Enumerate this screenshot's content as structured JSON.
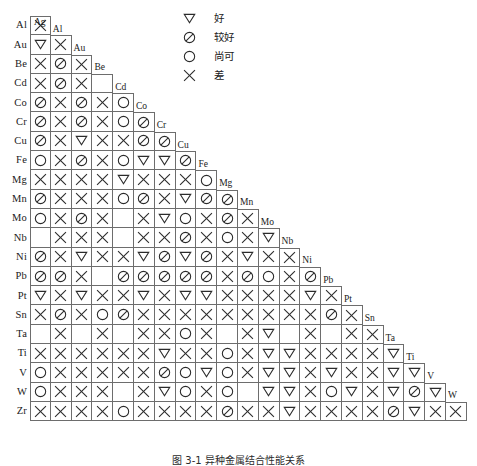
{
  "figure": {
    "caption": "图 3-1  异种金属结合性能关系"
  },
  "legend": {
    "items": [
      {
        "symbol": "triangle-down",
        "label": "好"
      },
      {
        "symbol": "circle-slash",
        "label": "较好"
      },
      {
        "symbol": "circle",
        "label": "尚可"
      },
      {
        "symbol": "cross",
        "label": "差"
      }
    ]
  },
  "matrix": {
    "row_labels": [
      "Al",
      "Au",
      "Be",
      "Cd",
      "Co",
      "Cr",
      "Cu",
      "Fe",
      "Mg",
      "Mn",
      "Mo",
      "Nb",
      "Ni",
      "Pb",
      "Pt",
      "Sn",
      "Ta",
      "Ti",
      "V",
      "W",
      "Zr"
    ],
    "column_labels": [
      "Ag",
      "Al",
      "Au",
      "Be",
      "Cd",
      "Co",
      "Cr",
      "Cu",
      "Fe",
      "Mg",
      "Mn",
      "Mo",
      "Nb",
      "Ni",
      "Pb",
      "Pt",
      "Sn",
      "Ta",
      "Ti",
      "V",
      "W"
    ],
    "symbol_meanings": {
      "triangle-down": "好",
      "circle-slash": "较好",
      "circle": "尚可",
      "cross": "差",
      "blank": ""
    },
    "rows": [
      {
        "label": "Al",
        "diagonal": "Al",
        "values": [
          "cross"
        ]
      },
      {
        "label": "Au",
        "diagonal": "Au",
        "values": [
          "triangle-down",
          "cross"
        ]
      },
      {
        "label": "Be",
        "diagonal": "Be",
        "values": [
          "cross",
          "circle-slash",
          "cross"
        ]
      },
      {
        "label": "Cd",
        "diagonal": "Cd",
        "values": [
          "cross",
          "circle-slash",
          "cross",
          "blank"
        ]
      },
      {
        "label": "Co",
        "diagonal": "Co",
        "values": [
          "circle-slash",
          "cross",
          "circle-slash",
          "cross",
          "circle"
        ]
      },
      {
        "label": "Cr",
        "diagonal": "Cr",
        "values": [
          "circle-slash",
          "cross",
          "circle-slash",
          "cross",
          "circle",
          "circle-slash"
        ]
      },
      {
        "label": "Cu",
        "diagonal": "Cu",
        "values": [
          "circle-slash",
          "cross",
          "triangle-down",
          "cross",
          "cross",
          "circle-slash",
          "circle-slash"
        ]
      },
      {
        "label": "Fe",
        "diagonal": "Fe",
        "values": [
          "circle",
          "cross",
          "circle-slash",
          "cross",
          "circle",
          "triangle-down",
          "triangle-down",
          "circle-slash"
        ]
      },
      {
        "label": "Mg",
        "diagonal": "Mg",
        "values": [
          "cross",
          "cross",
          "cross",
          "cross",
          "triangle-down",
          "cross",
          "cross",
          "cross",
          "circle"
        ]
      },
      {
        "label": "Mn",
        "diagonal": "Mn",
        "values": [
          "circle-slash",
          "cross",
          "cross",
          "cross",
          "circle",
          "circle-slash",
          "cross",
          "triangle-down",
          "circle-slash",
          "circle-slash"
        ]
      },
      {
        "label": "Mo",
        "diagonal": "Mo",
        "values": [
          "circle",
          "cross",
          "circle-slash",
          "cross",
          "blank",
          "cross",
          "triangle-down",
          "circle",
          "cross",
          "circle-slash",
          "cross"
        ]
      },
      {
        "label": "Nb",
        "diagonal": "Nb",
        "values": [
          "blank",
          "cross",
          "cross",
          "cross",
          "blank",
          "cross",
          "cross",
          "circle-slash",
          "cross",
          "circle",
          "cross",
          "triangle-down"
        ]
      },
      {
        "label": "Ni",
        "diagonal": "Ni",
        "values": [
          "circle-slash",
          "cross",
          "triangle-down",
          "cross",
          "cross",
          "triangle-down",
          "circle-slash",
          "triangle-down",
          "circle-slash",
          "cross",
          "triangle-down",
          "cross",
          "cross"
        ]
      },
      {
        "label": "Pb",
        "diagonal": "Pb",
        "values": [
          "circle-slash",
          "circle-slash",
          "cross",
          "blank",
          "circle-slash",
          "circle-slash",
          "circle-slash",
          "circle-slash",
          "circle-slash",
          "cross",
          "circle-slash",
          "circle",
          "cross",
          "circle-slash"
        ]
      },
      {
        "label": "Pt",
        "diagonal": "Pt",
        "values": [
          "triangle-down",
          "cross",
          "triangle-down",
          "cross",
          "cross",
          "triangle-down",
          "cross",
          "triangle-down",
          "triangle-down",
          "cross",
          "cross",
          "cross",
          "cross",
          "triangle-down",
          "cross"
        ]
      },
      {
        "label": "Sn",
        "diagonal": "Sn",
        "values": [
          "cross",
          "circle-slash",
          "cross",
          "circle",
          "circle-slash",
          "cross",
          "cross",
          "cross",
          "cross",
          "cross",
          "cross",
          "cross",
          "cross",
          "cross",
          "circle-slash",
          "cross"
        ]
      },
      {
        "label": "Ta",
        "diagonal": "Ta",
        "values": [
          "blank",
          "cross",
          "blank",
          "cross",
          "blank",
          "cross",
          "cross",
          "circle",
          "cross",
          "blank",
          "cross",
          "triangle-down",
          "blank",
          "cross",
          "blank",
          "cross",
          "cross"
        ]
      },
      {
        "label": "Ti",
        "diagonal": "Ti",
        "values": [
          "cross",
          "cross",
          "cross",
          "cross",
          "cross",
          "cross",
          "triangle-down",
          "cross",
          "cross",
          "circle",
          "cross",
          "triangle-down",
          "triangle-down",
          "cross",
          "cross",
          "cross",
          "cross",
          "triangle-down"
        ]
      },
      {
        "label": "V",
        "diagonal": "V",
        "values": [
          "circle",
          "cross",
          "cross",
          "cross",
          "cross",
          "cross",
          "circle-slash",
          "circle",
          "triangle-down",
          "circle",
          "cross",
          "triangle-down",
          "triangle-down",
          "cross",
          "triangle-down",
          "cross",
          "cross",
          "triangle-down",
          "triangle-down"
        ]
      },
      {
        "label": "W",
        "diagonal": "W",
        "values": [
          "circle",
          "cross",
          "cross",
          "cross",
          "blank",
          "cross",
          "triangle-down",
          "circle",
          "cross",
          "circle",
          "blank",
          "triangle-down",
          "triangle-down",
          "cross",
          "circle",
          "triangle-down",
          "cross",
          "triangle-down",
          "circle-slash",
          "triangle-down"
        ]
      },
      {
        "label": "Zr",
        "diagonal": "",
        "values": [
          "cross",
          "cross",
          "cross",
          "cross",
          "circle",
          "cross",
          "cross",
          "cross",
          "cross",
          "circle-slash",
          "cross",
          "cross",
          "triangle-down",
          "cross",
          "cross",
          "cross",
          "cross",
          "circle-slash",
          "triangle-down",
          "cross",
          "cross"
        ]
      }
    ]
  }
}
